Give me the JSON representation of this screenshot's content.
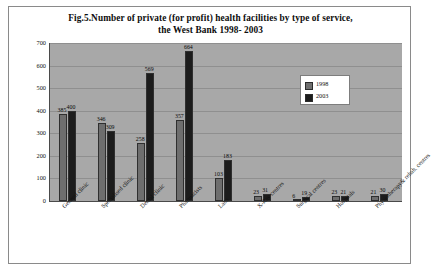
{
  "chart_data": {
    "type": "bar",
    "title": "Fig.5.Number of private (for profit) health facilities by type of service, the West Bank 1998- 2003",
    "title_line1": "Fig.5.Number of private (for profit) health facilities by type of service,",
    "title_line2": "the West Bank 1998- 2003",
    "xlabel": "",
    "ylabel": "",
    "ylim": [
      0,
      700
    ],
    "yticks": [
      "0",
      "100",
      "200",
      "300",
      "400",
      "500",
      "600",
      "700"
    ],
    "grid": true,
    "legend_position": "upper-right-inside",
    "categories": [
      "General clinic",
      "Specialised clinic",
      "Dental clinic",
      "Pharmacists",
      "Labs",
      "X-Ray centres",
      "Surgical centres",
      "Hospitals",
      "Physiotherapy& rehab. centres"
    ],
    "series": [
      {
        "name": "1998",
        "color": "#6e6e6e",
        "values": [
          385,
          346,
          258,
          357,
          103,
          23,
          6,
          23,
          21
        ]
      },
      {
        "name": "2003",
        "color": "#1c1c1c",
        "values": [
          400,
          309,
          569,
          664,
          183,
          31,
          19,
          21,
          30
        ]
      }
    ]
  },
  "legend": {
    "items": [
      {
        "label": "1998"
      },
      {
        "label": "2003"
      }
    ]
  }
}
